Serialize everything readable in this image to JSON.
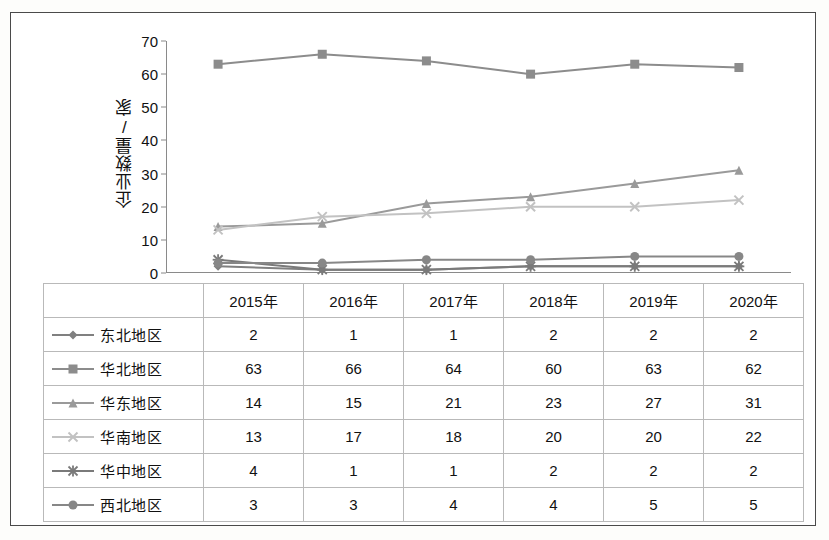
{
  "chart_data": {
    "type": "line",
    "title": "",
    "xlabel": "",
    "ylabel": "企业数量/家",
    "categories": [
      "2015年",
      "2016年",
      "2017年",
      "2018年",
      "2019年",
      "2020年"
    ],
    "ylim": [
      0,
      70
    ],
    "yticks": [
      0,
      10,
      20,
      30,
      40,
      50,
      60,
      70
    ],
    "grid": false,
    "legend_position": "bottom-table",
    "series": [
      {
        "name": "东北地区",
        "values": [
          2,
          1,
          1,
          2,
          2,
          2
        ],
        "color": "#808080",
        "marker": "diamond"
      },
      {
        "name": "华北地区",
        "values": [
          63,
          66,
          64,
          60,
          63,
          62
        ],
        "color": "#8c8c8c",
        "marker": "square"
      },
      {
        "name": "华东地区",
        "values": [
          14,
          15,
          21,
          23,
          27,
          31
        ],
        "color": "#9a9a9a",
        "marker": "triangle"
      },
      {
        "name": "华南地区",
        "values": [
          13,
          17,
          18,
          20,
          20,
          22
        ],
        "color": "#c2c2c2",
        "marker": "x"
      },
      {
        "name": "华中地区",
        "values": [
          4,
          1,
          1,
          2,
          2,
          2
        ],
        "color": "#7a7a7a",
        "marker": "star"
      },
      {
        "name": "西北地区",
        "values": [
          3,
          3,
          4,
          4,
          5,
          5
        ],
        "color": "#878787",
        "marker": "circle"
      }
    ]
  },
  "table": {
    "corner_label": "",
    "column_headers": [
      "2015年",
      "2016年",
      "2017年",
      "2018年",
      "2019年",
      "2020年"
    ],
    "rows": [
      {
        "name": "东北地区",
        "values": [
          "2",
          "1",
          "1",
          "2",
          "2",
          "2"
        ]
      },
      {
        "name": "华北地区",
        "values": [
          "63",
          "66",
          "64",
          "60",
          "63",
          "62"
        ]
      },
      {
        "name": "华东地区",
        "values": [
          "14",
          "15",
          "21",
          "23",
          "27",
          "31"
        ]
      },
      {
        "name": "华南地区",
        "values": [
          "13",
          "17",
          "18",
          "20",
          "20",
          "22"
        ]
      },
      {
        "name": "华中地区",
        "values": [
          "4",
          "1",
          "1",
          "2",
          "2",
          "2"
        ]
      },
      {
        "name": "西北地区",
        "values": [
          "3",
          "3",
          "4",
          "4",
          "5",
          "5"
        ]
      }
    ]
  }
}
